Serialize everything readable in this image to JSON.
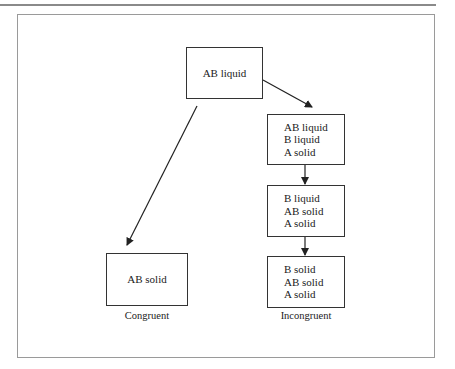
{
  "diagram": {
    "start_box": {
      "label": "AB liquid"
    },
    "congruent_branch": {
      "box": {
        "label": "AB solid"
      },
      "caption": "Congruent"
    },
    "incongruent_branch": {
      "boxes": [
        {
          "lines": [
            "AB liquid",
            "B liquid",
            "A solid"
          ]
        },
        {
          "lines": [
            "B liquid",
            "AB solid",
            "A solid"
          ]
        },
        {
          "lines": [
            "B solid",
            "AB solid",
            "A solid"
          ]
        }
      ],
      "caption": "Incongruent"
    },
    "colors": {
      "box_border": "#333333",
      "frame_border": "#9a9a9a",
      "arrow": "#222222"
    }
  }
}
